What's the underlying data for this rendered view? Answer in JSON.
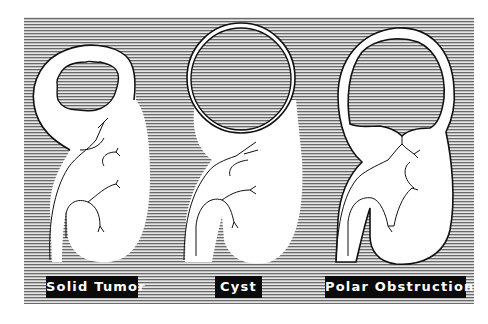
{
  "figure": {
    "background_pattern": "horizontal-line-hatching",
    "colors": {
      "hatch_line": "#6f6f6f",
      "hatch_bg": "#e4e4e4",
      "organ_fill": "#ffffff",
      "outline": "#111111",
      "label_bg": "#0a0a0a",
      "label_text": "#ffffff"
    },
    "panels": [
      {
        "id": "solid-tumor",
        "label": "Solid Tumor",
        "description": "Kidney with irregular solid mass in upper pole, thick parenchyma around it"
      },
      {
        "id": "cyst",
        "label": "Cyst",
        "description": "Kidney with large round thin-walled cyst at upper pole"
      },
      {
        "id": "polar-obstruction",
        "label": "Polar Obstruction",
        "description": "Kidney with dilated obstructed upper pole calyx, thin cortical rim"
      }
    ]
  }
}
